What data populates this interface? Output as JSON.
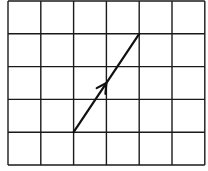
{
  "diagram": {
    "type": "grid-vector",
    "grid": {
      "columns": 6,
      "rows": 5,
      "cell_size_px": 32.8,
      "origin_px": [
        8,
        1
      ],
      "line_color": "#1a1a1a",
      "line_width": 1.4
    },
    "vector": {
      "start_cell": [
        2,
        4
      ],
      "end_cell": [
        4,
        1
      ],
      "direction": "up-right",
      "arrowhead_position": "midpoint",
      "color": "#111111",
      "width": 2.2
    }
  }
}
